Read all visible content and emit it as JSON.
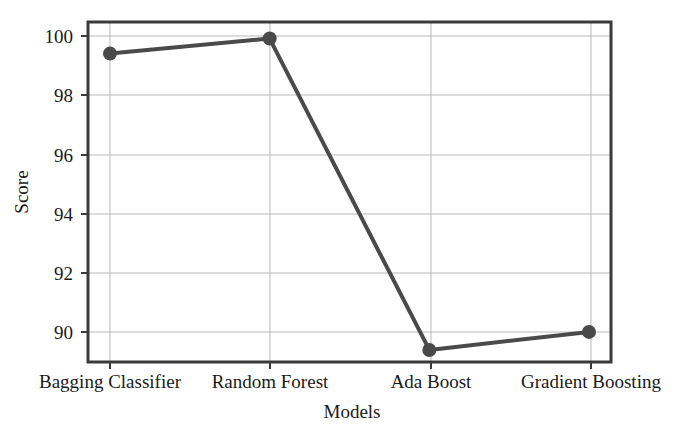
{
  "chart_data": {
    "type": "line",
    "title": "",
    "subtitle": "",
    "xlabel": "Models",
    "ylabel": "Score",
    "categories": [
      "Bagging Classifier",
      "Random Forest",
      "Ada Boost",
      "Gradient Boosting"
    ],
    "values": [
      99.5,
      100.0,
      89.65,
      90.25
    ],
    "series": [
      {
        "name": "Score",
        "values": [
          99.5,
          100.0,
          89.65,
          90.25
        ]
      }
    ],
    "ylim": [
      89.25,
      100.55
    ],
    "yticks": [
      90,
      92,
      94,
      96,
      98,
      100
    ],
    "ytick_labels": [
      "90",
      "92",
      "94",
      "96",
      "98",
      "100"
    ],
    "xticks": [
      0,
      1,
      2,
      3
    ],
    "grid": true,
    "grid_axis": "both",
    "legend": false,
    "legend_position": "none",
    "marker": "circle",
    "annotations": []
  },
  "style": {
    "line_color": "#4a4a4a",
    "marker_color": "#4a4a4a",
    "grid_color": "#b9b9b9",
    "axis_color": "#3a3a3a",
    "background_color": "#ffffff",
    "text_color": "#1a1a1a"
  },
  "axis_titles": {
    "x": "Models",
    "y": "Score"
  },
  "y_tick_labels": {
    "t0": "90",
    "t1": "92",
    "t2": "94",
    "t3": "96",
    "t4": "98",
    "t5": "100"
  },
  "x_tick_labels": {
    "t0": "Bagging Classifier",
    "t1": "Random Forest",
    "t2": "Ada Boost",
    "t3": "Gradient Boosting"
  }
}
